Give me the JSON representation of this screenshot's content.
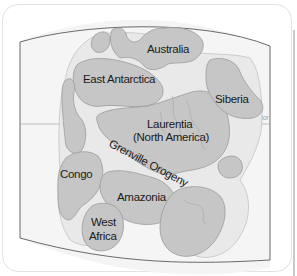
{
  "map": {
    "title": "Rodinia supercontinent reconstruction",
    "reference_lines": {
      "equator_label": "Equator"
    },
    "continents": [
      {
        "id": "australia",
        "label": "Australia"
      },
      {
        "id": "east-antarctica",
        "label": "East Antarctica"
      },
      {
        "id": "siberia",
        "label": "Siberia"
      },
      {
        "id": "laurentia",
        "label_line1": "Laurentia",
        "label_line2": "(North America)"
      },
      {
        "id": "congo",
        "label": "Congo"
      },
      {
        "id": "amazonia",
        "label": "Amazonia"
      },
      {
        "id": "west-africa",
        "label_line1": "West",
        "label_line2": "Africa"
      }
    ],
    "orogeny_label": "Grenville Orogeny",
    "colors": {
      "land": "#c6c6c6",
      "shelf": "#e9e9e9",
      "ocean": "#f4f4f4",
      "outline": "#5a5a5a"
    }
  }
}
